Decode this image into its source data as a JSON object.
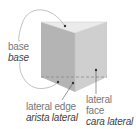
{
  "diagram": {
    "labels": {
      "base": {
        "en": "base",
        "es": "base"
      },
      "lateral_edge": {
        "en": "lateral edge",
        "es": "arista lateral"
      },
      "lateral_face": {
        "en_line1": "lateral",
        "en_line2": "face",
        "es": "cara lateral"
      }
    },
    "colors": {
      "top_face": "#ebebeb",
      "left_face": "#b4b4b4",
      "right_face": "#cfcfcf",
      "edge": "#9a9a9a",
      "pointer": "#444444",
      "hidden_edge": "#8a8a8a"
    }
  }
}
